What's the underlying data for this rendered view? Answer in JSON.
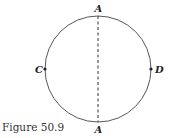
{
  "figure": {
    "caption": "Figure 50.9",
    "circle": {
      "cx": 98,
      "cy": 69,
      "r": 53,
      "stroke": "#444444"
    },
    "diameter": {
      "style": "dashed",
      "from": "A",
      "to": "A",
      "orientation": "vertical"
    },
    "points": [
      {
        "label": "A",
        "position": "top"
      },
      {
        "label": "A",
        "position": "bottom"
      },
      {
        "label": "C",
        "position": "left"
      },
      {
        "label": "D",
        "position": "right"
      }
    ]
  }
}
